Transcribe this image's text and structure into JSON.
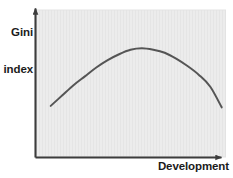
{
  "figure": {
    "background_color": "#ffffff",
    "plot_background_color": "#ececec",
    "axis_color": "#3c3c3c",
    "curve_color": "#555555"
  },
  "axes": {
    "y_label_line1": "Gini",
    "y_label_line2": "index",
    "x_label": "Development"
  },
  "chart_data": {
    "type": "line",
    "title": "",
    "subtitle": "",
    "xlabel": "Development",
    "ylabel": "Gini index",
    "legend": [],
    "legend_position": "none",
    "grid": false,
    "xlim": [
      0,
      100
    ],
    "ylim": [
      0,
      100
    ],
    "xticks": [],
    "yticks": [],
    "xticklabels": [],
    "yticklabels": [],
    "annotations": [],
    "series": [
      {
        "name": "Kuznets curve",
        "color": "#555555",
        "x": [
          8,
          14,
          20,
          26,
          32,
          38,
          44,
          50,
          56,
          62,
          68,
          74,
          80,
          86,
          92,
          98
        ],
        "y": [
          35,
          42,
          49,
          55,
          61,
          66,
          70,
          73,
          74,
          73,
          71,
          67,
          62,
          56,
          48,
          34
        ]
      }
    ]
  }
}
